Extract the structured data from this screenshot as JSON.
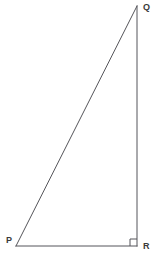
{
  "figure": {
    "background_color": "#ffffff",
    "line_color": "#55555a",
    "label_color": "#3a3a3a",
    "vertices": [
      {
        "name": "P",
        "label": "P",
        "x": 16,
        "y": 246,
        "label_x": 6,
        "label_y": 241
      },
      {
        "name": "Q",
        "label": "Q",
        "x": 137,
        "y": 6,
        "label_x": 143,
        "label_y": 8
      },
      {
        "name": "R",
        "label": "R",
        "x": 137,
        "y": 246,
        "label_x": 143,
        "label_y": 247
      }
    ],
    "edges": [
      {
        "name": "hypotenuse-pq",
        "from": "P",
        "to": "Q"
      },
      {
        "name": "leg-qr",
        "from": "Q",
        "to": "R"
      },
      {
        "name": "leg-pr",
        "from": "P",
        "to": "R"
      }
    ],
    "right_angle": {
      "at_vertex": "R",
      "size": 7,
      "marker": "square"
    }
  }
}
